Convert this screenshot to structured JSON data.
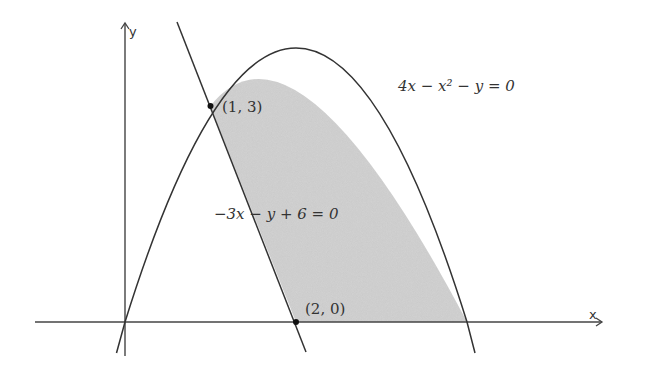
{
  "diagram": {
    "type": "region-between-curves",
    "axes": {
      "x_label": "x",
      "y_label": "y"
    },
    "curves": [
      {
        "id": "parabola",
        "equation": "4x − x² − y = 0",
        "form": "y = 4x − x^2"
      },
      {
        "id": "line",
        "equation": "−3x − y + 6 = 0",
        "form": "y = 6 − 3x"
      }
    ],
    "points": [
      {
        "label": "(1, 3)",
        "x": 1,
        "y": 3
      },
      {
        "label": "(2, 0)",
        "x": 2,
        "y": 0
      }
    ],
    "shaded_region": "bounded by line y = 6 − 3x, parabola y = 4x − x², and x-axis",
    "colors": {
      "shade": "#c8c8c8",
      "stroke": "#333333",
      "background": "#ffffff"
    }
  }
}
